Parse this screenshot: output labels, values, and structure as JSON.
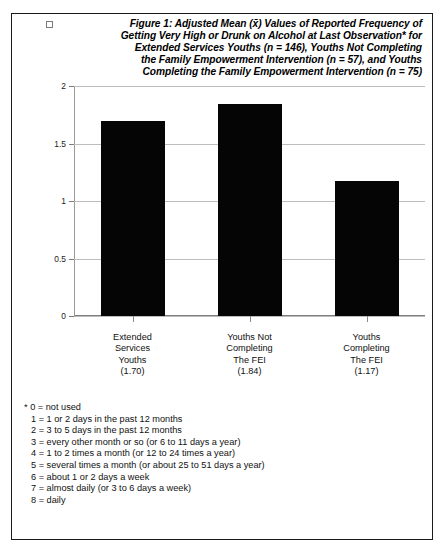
{
  "figure": {
    "checkbox_icon": "checkbox-icon",
    "title_lines": [
      "Figure 1: Adjusted Mean (x̄) Values of Reported Frequency of",
      "Getting Very High or Drunk on Alcohol at Last Observation* for",
      "Extended Services Youths (n = 146), Youths Not Completing",
      "the Family Empowerment Intervention (n = 57), and Youths",
      "Completing the  Family Empowerment Intervention  (n = 75)"
    ]
  },
  "chart_data": {
    "type": "bar",
    "xlabel": "",
    "ylabel": "",
    "categories": [
      "Extended Services Youths",
      "Youths Not Completing The FEI",
      "Youths Completing The FEI"
    ],
    "category_label_lines": [
      [
        "Extended",
        "Services",
        "Youths",
        "(1.70)"
      ],
      [
        "Youths Not",
        "Completing",
        "The FEI",
        "(1.84)"
      ],
      [
        "Youths",
        "Completing",
        "The FEI",
        "(1.17)"
      ]
    ],
    "values": [
      1.7,
      1.84,
      1.17
    ],
    "value_labels": [
      "(1.70)",
      "(1.84)",
      "(1.17)"
    ],
    "group_sizes": [
      146,
      57,
      75
    ],
    "ylim": [
      0,
      2
    ],
    "yticks": [
      0,
      0.5,
      1,
      1.5,
      2
    ],
    "ytick_labels": [
      "0",
      "0.5",
      "1",
      "1.5",
      "2"
    ],
    "grid": true,
    "legend": "none",
    "bar_color": "#050505",
    "gridline_color": "#bdbdbd",
    "axis_color": "#7d7d7d"
  },
  "footnote": {
    "lines": [
      "* 0 = not used",
      "1 = 1 or 2 days in the past 12 months",
      "2 = 3 to 5 days in the past 12 months",
      "3 = every other month or so (or 6 to 11 days a year)",
      "4 = 1 to 2 times a month (or 12 to 24 times a year)",
      "5 = several times a month (or about 25 to 51 days a year)",
      "6 = about 1 or 2 days a week",
      "7 = almost daily (or 3 to 6 days a week)",
      "8 = daily"
    ]
  }
}
